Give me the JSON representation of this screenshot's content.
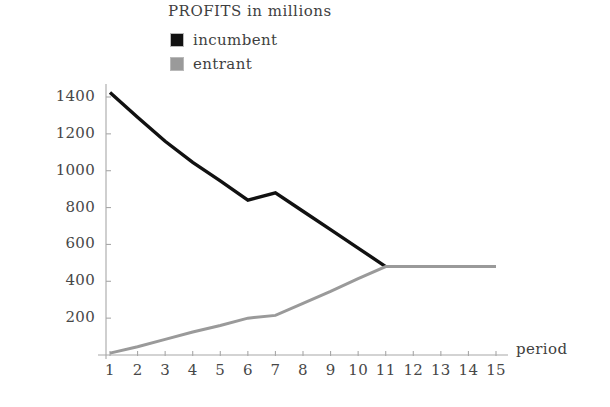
{
  "chart": {
    "title": "PROFITS in millions",
    "xlabel": "period",
    "legend": [
      {
        "label": "incumbent",
        "color": "#111111"
      },
      {
        "label": "entrant",
        "color": "#9a9a9a"
      }
    ]
  },
  "chart_data": {
    "type": "line",
    "title": "PROFITS in millions",
    "xlabel": "period",
    "ylabel": "",
    "xlim": [
      0,
      15.6
    ],
    "ylim": [
      0,
      1480
    ],
    "grid": false,
    "legend_position": "top-center",
    "x": [
      1,
      2,
      3,
      4,
      5,
      6,
      7,
      8,
      9,
      10,
      11,
      12,
      13,
      14,
      15
    ],
    "xticks": [
      "1",
      "2",
      "3",
      "4",
      "5",
      "6",
      "7",
      "8",
      "9",
      "10",
      "11",
      "12",
      "13",
      "14",
      "15"
    ],
    "yticks": [
      "200",
      "400",
      "600",
      "800",
      "1000",
      "1200",
      "1400"
    ],
    "ytick_values": [
      200,
      400,
      600,
      800,
      1000,
      1200,
      1400
    ],
    "series": [
      {
        "name": "incumbent",
        "color": "#111111",
        "values": [
          1425,
          1290,
          1160,
          1045,
          945,
          840,
          880,
          780,
          680,
          580,
          480,
          null,
          null,
          null,
          null
        ]
      },
      {
        "name": "entrant",
        "color": "#9a9a9a",
        "values": [
          10,
          45,
          85,
          125,
          160,
          200,
          215,
          280,
          345,
          415,
          480,
          480,
          480,
          480,
          480
        ]
      }
    ]
  }
}
